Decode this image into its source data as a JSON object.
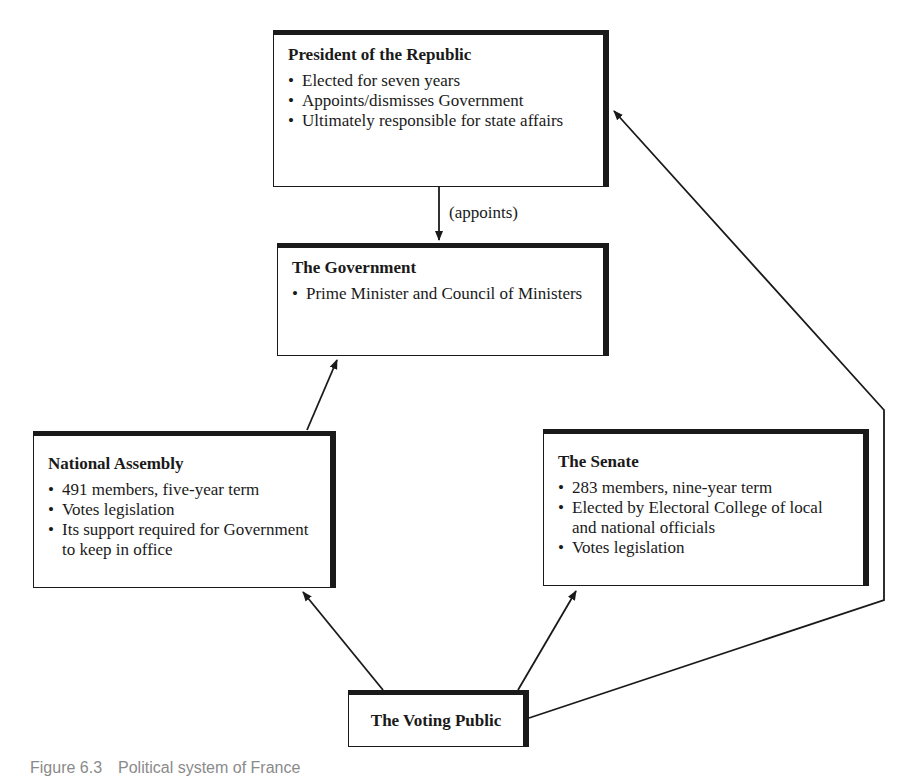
{
  "diagram": {
    "nodes": [
      {
        "id": "president",
        "title": "President of the Republic",
        "bullets": [
          "Elected for seven years",
          "Appoints/dismisses Government",
          "Ultimately responsible for state affairs"
        ]
      },
      {
        "id": "government",
        "title": "The Government",
        "bullets": [
          "Prime Minister and Council of Ministers"
        ]
      },
      {
        "id": "assembly",
        "title": "National Assembly",
        "bullets": [
          "491 members, five-year term",
          "Votes legislation",
          "Its support required for Government to keep in office"
        ]
      },
      {
        "id": "senate",
        "title": "The Senate",
        "bullets": [
          "283 members, nine-year term",
          "Elected by Electoral College of local and national officials",
          "Votes legislation"
        ]
      },
      {
        "id": "public",
        "title": "The Voting Public",
        "bullets": []
      }
    ],
    "edges": [
      {
        "from": "president",
        "to": "government",
        "label": "(appoints)"
      },
      {
        "from": "assembly",
        "to": "government",
        "label": ""
      },
      {
        "from": "public",
        "to": "assembly",
        "label": ""
      },
      {
        "from": "public",
        "to": "senate",
        "label": ""
      },
      {
        "from": "public",
        "to": "president",
        "label": ""
      }
    ],
    "caption": {
      "number": "Figure 6.3",
      "text": "Political system of France"
    },
    "colors": {
      "ink": "#1a1a1a",
      "background": "#ffffff",
      "caption": "#8a8a8a"
    }
  }
}
